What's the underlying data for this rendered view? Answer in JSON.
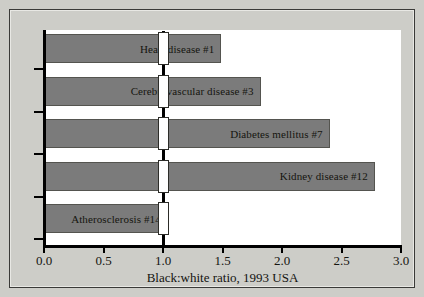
{
  "chart_data": {
    "type": "bar",
    "orientation": "horizontal",
    "title": "",
    "xlabel": "Black:white ratio, 1993 USA",
    "ylabel": "",
    "xlim": [
      0.0,
      3.0
    ],
    "xticks": [
      "0.0",
      "0.5",
      "1.0",
      "1.5",
      "2.0",
      "2.5",
      "3.0"
    ],
    "xtick_values": [
      0.0,
      0.5,
      1.0,
      1.5,
      2.0,
      2.5,
      3.0
    ],
    "grid": false,
    "legend": null,
    "reference_line": 1.0,
    "bar_color": "#7b7b7b",
    "plot_background": "#ffffff",
    "figure_background": "#cdcdc8",
    "categories": [
      "Heart disease #1",
      "Cerebrovascular disease #3",
      "Diabetes mellitus #7",
      "Kidney disease #12",
      "Atherosclerosis #14"
    ],
    "values": [
      1.49,
      1.82,
      2.4,
      2.78,
      1.04
    ],
    "bars": [
      {
        "label": "Heart disease #1",
        "value": 1.49
      },
      {
        "label": "Cerebrovascular disease #3",
        "value": 1.82
      },
      {
        "label": "Diabetes mellitus #7",
        "value": 2.4
      },
      {
        "label": "Kidney disease #12",
        "value": 2.78
      },
      {
        "label": "Atherosclerosis #14",
        "value": 1.04
      }
    ]
  }
}
